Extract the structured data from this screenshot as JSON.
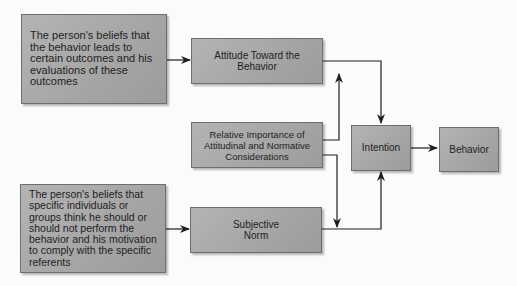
{
  "diagram": {
    "colors": {
      "box_fill": "#a8a8a8",
      "box_border": "#6e6e6e",
      "line": "#1e1e1e",
      "background": "#fbfbfa"
    },
    "nodes": {
      "beliefs_outcomes": {
        "label": "The person's beliefs that the behavior leads to certain outcomes and his evaluations of these outcomes"
      },
      "attitude": {
        "label": "Attitude Toward the Behavior"
      },
      "relative_importance": {
        "label": "Relative Importance of Attitudinal and Normative Considerations"
      },
      "normative_beliefs": {
        "label": "The person's beliefs that specific individuals or groups think he should or should not perform the behavior and his motivation to comply with the specific referents"
      },
      "subjective_norm": {
        "label": "Subjective Norm"
      },
      "intention": {
        "label": "Intention"
      },
      "behavior": {
        "label": "Behavior"
      }
    },
    "edges": [
      {
        "from": "beliefs_outcomes",
        "to": "attitude"
      },
      {
        "from": "normative_beliefs",
        "to": "subjective_norm"
      },
      {
        "from": "attitude",
        "to": "intention"
      },
      {
        "from": "subjective_norm",
        "to": "intention"
      },
      {
        "from": "relative_importance",
        "to": "attitude-intention link"
      },
      {
        "from": "relative_importance",
        "to": "subjective-norm-intention link"
      },
      {
        "from": "intention",
        "to": "behavior"
      }
    ]
  }
}
